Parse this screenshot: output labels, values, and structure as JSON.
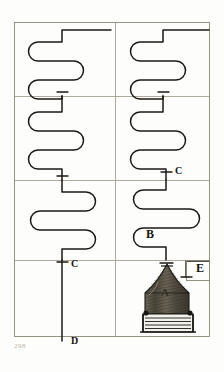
{
  "plate": {
    "title": "Distillation apparatus plate",
    "caption": "",
    "folio": "298",
    "ink_color": "#1a1813",
    "rule_color": "#8d8878",
    "paper_color": "#fdfdfc"
  },
  "labels": {
    "a": "A",
    "b": "B",
    "c_upper": "C",
    "c_lower": "C",
    "d": "D",
    "e": "E"
  },
  "figure": {
    "frame": {
      "x": 14,
      "y": 22,
      "width": 196,
      "height": 315
    },
    "grid": {
      "vertical_rules_x": [
        115
      ],
      "horizontal_rules_y": [
        96,
        180,
        260
      ]
    },
    "coil_columns": [
      {
        "name": "left-column",
        "passes": 4
      },
      {
        "name": "right-column",
        "passes": 4
      }
    ],
    "junction_marks": [
      {
        "name": "junction-left-upper",
        "x": 62,
        "y": 92
      },
      {
        "name": "junction-right-upper",
        "x": 163,
        "y": 92
      },
      {
        "name": "junction-right-middle",
        "x": 166,
        "y": 172
      },
      {
        "name": "junction-left-middle",
        "x": 62,
        "y": 176
      },
      {
        "name": "junction-left-lower",
        "x": 62,
        "y": 262
      },
      {
        "name": "junction-vessel-neck",
        "x": 166,
        "y": 262
      },
      {
        "name": "junction-side-tube",
        "x": 186,
        "y": 277
      }
    ],
    "vessel": {
      "name": "alembic-still",
      "x": 145,
      "y": 264,
      "width": 44,
      "height": 52,
      "body_fill": "#5c564a"
    },
    "grate": {
      "name": "furnace-grate",
      "x": 143,
      "y": 313,
      "width": 50,
      "height": 20
    }
  }
}
